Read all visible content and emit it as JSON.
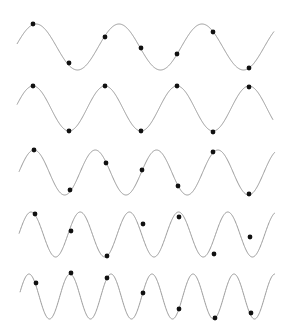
{
  "colors": {
    "line": "#9a9a9a",
    "dot": "#111111",
    "background": "#ffffff"
  },
  "dot_radius": 2.4,
  "sample_x": [
    34,
    70,
    106,
    142,
    178,
    214,
    250
  ],
  "waves": [
    {
      "name": "wave-1",
      "x_start": 17,
      "x_end": 274,
      "center_y": 47,
      "amplitude": 23,
      "period": 83,
      "peak_x": 36,
      "dots": [
        [
          33,
          24
        ],
        [
          69,
          63
        ],
        [
          105,
          37
        ],
        [
          141,
          48
        ],
        [
          177,
          54
        ],
        [
          213,
          32
        ],
        [
          249,
          68
        ]
      ]
    },
    {
      "name": "wave-2",
      "x_start": 17,
      "x_end": 273,
      "center_y": 108.5,
      "amplitude": 22.5,
      "period": 72,
      "peak_x": 33,
      "dots": [
        [
          33,
          86
        ],
        [
          69,
          131
        ],
        [
          105,
          86
        ],
        [
          141,
          131
        ],
        [
          177,
          86
        ],
        [
          213,
          132
        ],
        [
          249,
          87
        ]
      ]
    },
    {
      "name": "wave-3",
      "x_start": 19,
      "x_end": 275,
      "center_y": 172.5,
      "amplitude": 22.5,
      "period": 61.3,
      "peak_x": 34,
      "dots": [
        [
          34,
          150
        ],
        [
          70,
          190
        ],
        [
          106,
          163
        ],
        [
          142,
          170
        ],
        [
          178,
          186
        ],
        [
          213,
          152
        ],
        [
          249,
          194
        ]
      ]
    },
    {
      "name": "wave-4",
      "x_start": 19,
      "x_end": 275,
      "center_y": 234.5,
      "amplitude": 22.5,
      "period": 49.2,
      "peak_x": 31,
      "dots": [
        [
          35,
          214
        ],
        [
          71,
          231
        ],
        [
          107,
          256
        ],
        [
          143,
          224
        ],
        [
          179,
          217
        ],
        [
          214,
          254
        ],
        [
          250,
          237
        ]
      ]
    },
    {
      "name": "wave-5",
      "x_start": 20,
      "x_end": 275,
      "center_y": 296.5,
      "amplitude": 22.5,
      "period": 41,
      "peak_x": 29,
      "dots": [
        [
          36,
          283
        ],
        [
          71,
          273
        ],
        [
          107,
          278
        ],
        [
          143,
          293
        ],
        [
          179,
          309
        ],
        [
          215,
          318
        ],
        [
          251,
          313
        ]
      ]
    }
  ]
}
